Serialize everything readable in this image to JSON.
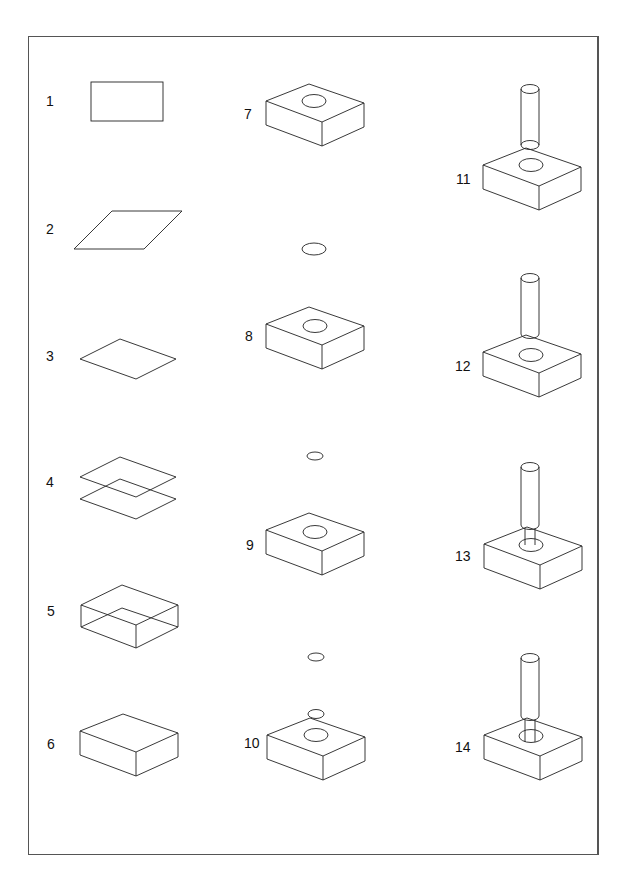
{
  "diagram": {
    "type": "step-by-step isometric construction sequence",
    "steps": [
      {
        "number": "1",
        "description": "rectangle"
      },
      {
        "number": "2",
        "description": "skewed parallelogram"
      },
      {
        "number": "3",
        "description": "isometric rhombus (top face)"
      },
      {
        "number": "4",
        "description": "two stacked rhombuses"
      },
      {
        "number": "5",
        "description": "wireframe box with hidden edges"
      },
      {
        "number": "6",
        "description": "solid box"
      },
      {
        "number": "7",
        "description": "box with ellipse on top face"
      },
      {
        "number": "8",
        "description": "box with ellipse and separate ellipse above"
      },
      {
        "number": "9",
        "description": "box with ellipse and smaller ellipse above"
      },
      {
        "number": "10",
        "description": "box with ellipse and ellipses stacked above"
      },
      {
        "number": "11",
        "description": "cylinder above box"
      },
      {
        "number": "12",
        "description": "cylinder touching box top"
      },
      {
        "number": "13",
        "description": "cylinder entering hole in box"
      },
      {
        "number": "14",
        "description": "cylinder inserted into hole in box"
      }
    ]
  },
  "labels": {
    "l1": "1",
    "l2": "2",
    "l3": "3",
    "l4": "4",
    "l5": "5",
    "l6": "6",
    "l7": "7",
    "l8": "8",
    "l9": "9",
    "l10": "10",
    "l11": "11",
    "l12": "12",
    "l13": "13",
    "l14": "14"
  },
  "colors": {
    "stroke": "#222222",
    "frame": "#555555",
    "background": "#ffffff"
  }
}
